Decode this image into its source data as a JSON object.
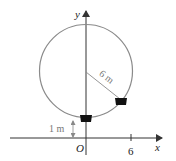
{
  "diagram": {
    "type": "ferris-wheel",
    "axes": {
      "x_label": "x",
      "y_label": "y",
      "origin_label": "O",
      "x_tick_label": "6"
    },
    "circle": {
      "radius_label": "6 m"
    },
    "height_label": "1 m",
    "colors": {
      "circle": "#8a8a8a",
      "axes": "#333333",
      "cart": "#111111",
      "annotation": "#888888"
    }
  }
}
